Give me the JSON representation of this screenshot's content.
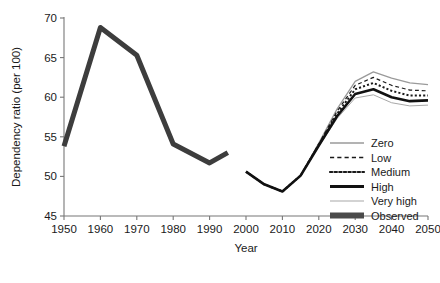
{
  "chart_data": {
    "type": "line",
    "title": "",
    "xlabel": "Year",
    "ylabel": "Dependency ratio (per 100)",
    "xlim": [
      1950,
      2050
    ],
    "ylim": [
      45,
      70
    ],
    "xticks": [
      1950,
      1960,
      1970,
      1980,
      1990,
      2000,
      2010,
      2020,
      2030,
      2040,
      2050
    ],
    "yticks": [
      45,
      50,
      55,
      60,
      65,
      70
    ],
    "grid": false,
    "legend_position": "inside-right-lower",
    "series": [
      {
        "name": "Zero",
        "style": "solid",
        "color": "#9a9a9a",
        "width": 1.3,
        "x": [
          2000,
          2005,
          2010,
          2015,
          2020,
          2025,
          2030,
          2035,
          2040,
          2045,
          2050
        ],
        "values": [
          50.6,
          49.0,
          48.1,
          50.1,
          54.2,
          58.5,
          62.0,
          63.2,
          62.4,
          61.8,
          61.6
        ]
      },
      {
        "name": "Low",
        "style": "dashed",
        "color": "#1a1a1a",
        "width": 1.2,
        "x": [
          2000,
          2005,
          2010,
          2015,
          2020,
          2025,
          2030,
          2035,
          2040,
          2045,
          2050
        ],
        "values": [
          50.6,
          49.0,
          48.1,
          50.1,
          54.1,
          58.2,
          61.5,
          62.5,
          61.5,
          60.9,
          60.8
        ]
      },
      {
        "name": "Medium",
        "style": "dotted",
        "color": "#1a1a1a",
        "width": 2.0,
        "x": [
          2000,
          2005,
          2010,
          2015,
          2020,
          2025,
          2030,
          2035,
          2040,
          2045,
          2050
        ],
        "values": [
          50.6,
          49.0,
          48.1,
          50.1,
          54.0,
          57.9,
          61.0,
          61.8,
          60.8,
          60.2,
          60.2
        ]
      },
      {
        "name": "High",
        "style": "solid",
        "color": "#111111",
        "width": 2.6,
        "x": [
          2000,
          2005,
          2010,
          2015,
          2020,
          2025,
          2030,
          2035,
          2040,
          2045,
          2050
        ],
        "values": [
          50.6,
          49.0,
          48.1,
          50.1,
          53.9,
          57.6,
          60.4,
          61.0,
          60.0,
          59.5,
          59.6
        ]
      },
      {
        "name": "Very high",
        "style": "solid",
        "color": "#a8a8a8",
        "width": 1.0,
        "x": [
          2000,
          2005,
          2010,
          2015,
          2020,
          2025,
          2030,
          2035,
          2040,
          2045,
          2050
        ],
        "values": [
          50.6,
          49.0,
          48.1,
          50.1,
          53.8,
          57.3,
          59.9,
          60.3,
          59.3,
          58.9,
          59.0
        ]
      },
      {
        "name": "Observed",
        "style": "solid",
        "color": "#3d3d3d",
        "width": 5.0,
        "x": [
          1950,
          1960,
          1970,
          1980,
          1990,
          1995
        ],
        "values": [
          53.8,
          68.8,
          65.3,
          54.1,
          51.7,
          53.0
        ]
      }
    ],
    "legend": [
      {
        "label": "Zero",
        "style": "solid",
        "color": "#9a9a9a",
        "width": 1.5
      },
      {
        "label": "Low",
        "style": "dashed",
        "color": "#1a1a1a",
        "width": 1.3
      },
      {
        "label": "Medium",
        "style": "dotted",
        "color": "#1a1a1a",
        "width": 2.2
      },
      {
        "label": "High",
        "style": "solid",
        "color": "#111111",
        "width": 3.0
      },
      {
        "label": "Very high",
        "style": "solid",
        "color": "#a8a8a8",
        "width": 1.1
      },
      {
        "label": "Observed",
        "style": "solid",
        "color": "#4a4a4a",
        "width": 6.0
      }
    ]
  }
}
